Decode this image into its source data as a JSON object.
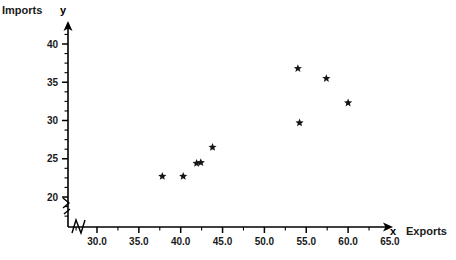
{
  "chart_data": {
    "type": "scatter",
    "title": "",
    "xlabel": "Exports",
    "ylabel": "Imports",
    "x_var": "x",
    "y_var": "y",
    "xlim": [
      27.5,
      67.5
    ],
    "ylim": [
      17.5,
      42.5
    ],
    "xticks": [
      "30.0",
      "35.0",
      "40.0",
      "45.0",
      "50.0",
      "55.0",
      "60.0",
      "65.0"
    ],
    "xtick_values": [
      30.0,
      35.0,
      40.0,
      45.0,
      50.0,
      55.0,
      60.0,
      65.0
    ],
    "yticks": [
      "20",
      "25",
      "30",
      "35",
      "40"
    ],
    "ytick_values": [
      20,
      25,
      30,
      35,
      40
    ],
    "minor_tick_step_x": 2.5,
    "minor_tick_step_y": 1.25,
    "grid": false,
    "legend": false,
    "axis_break_x": true,
    "axis_break_y": true,
    "marker": "star",
    "marker_color": "#161616",
    "points": [
      {
        "x": 37.8,
        "y": 22.7
      },
      {
        "x": 40.3,
        "y": 22.7
      },
      {
        "x": 41.9,
        "y": 24.4
      },
      {
        "x": 42.4,
        "y": 24.5
      },
      {
        "x": 43.8,
        "y": 26.5
      },
      {
        "x": 54.0,
        "y": 36.8
      },
      {
        "x": 54.2,
        "y": 29.7
      },
      {
        "x": 57.4,
        "y": 35.5
      },
      {
        "x": 60.0,
        "y": 32.3
      }
    ]
  },
  "labels": {
    "y_axis_title": "Imports",
    "y_axis_var": "y",
    "x_axis_title": "Exports",
    "x_axis_var": "x"
  }
}
